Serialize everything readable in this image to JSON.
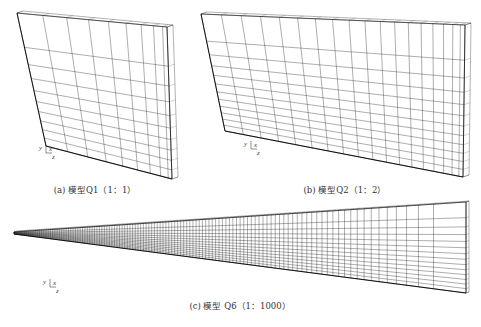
{
  "figure": {
    "panels": [
      {
        "id": "a",
        "caption": "(a) 模型Q1（1：1）",
        "caption_pos": [
          95,
          183
        ],
        "front_face": {
          "tl": [
            17,
            13
          ],
          "tr": [
            167,
            27
          ],
          "br": [
            172,
            179
          ],
          "bl": [
            46,
            146
          ]
        },
        "depth_offset": [
          6,
          -2
        ],
        "cols": 9,
        "rows": 10,
        "col_bias": 1.6,
        "row_bias": 1.7,
        "axis_triad": {
          "origin": [
            46,
            153
          ],
          "labels": {
            "y": "y",
            "x": "x",
            "z": "z"
          }
        }
      },
      {
        "id": "b",
        "caption": "(b) 模型Q2（1：2）",
        "caption_pos": [
          345,
          183
        ],
        "front_face": {
          "tl": [
            201,
            14
          ],
          "tr": [
            465,
            25
          ],
          "br": [
            463,
            177
          ],
          "bl": [
            225,
            131
          ]
        },
        "depth_offset": [
          6,
          -2
        ],
        "cols": 18,
        "rows": 12,
        "col_bias": 1.4,
        "row_bias": 1.7,
        "axis_triad": {
          "origin": [
            251,
            149
          ],
          "labels": {
            "y": "y",
            "x": "x",
            "z": "z"
          }
        }
      },
      {
        "id": "c",
        "caption": "(c) 模型 Q6（1：1000）",
        "caption_pos": [
          240,
          299
        ],
        "front_face": {
          "tl": [
            14,
            232
          ],
          "tr": [
            466,
            202
          ],
          "br": [
            466,
            293
          ],
          "bl": [
            14,
            234
          ]
        },
        "depth_offset": [
          3,
          -1
        ],
        "cols": 120,
        "rows": 14,
        "col_bias": 0.55,
        "row_bias": 1.5,
        "axis_triad": {
          "origin": [
            50,
            287
          ],
          "labels": {
            "y": "y",
            "x": "x",
            "z": "z"
          }
        }
      }
    ],
    "colors": {
      "mesh": "#2a2a2a",
      "edge": "#111111",
      "background": "#ffffff"
    }
  }
}
